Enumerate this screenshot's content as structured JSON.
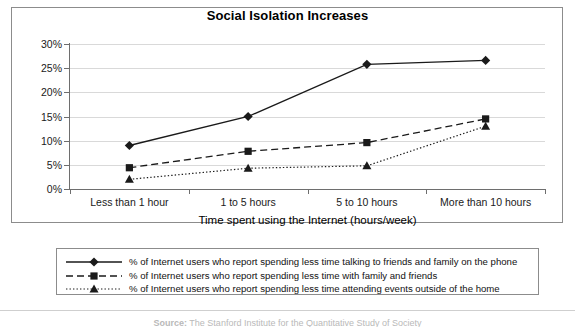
{
  "chart_data": {
    "type": "line",
    "title": "Social Isolation Increases",
    "xlabel": "Time spent using the Internet (hours/week)",
    "ylabel": "",
    "categories": [
      "Less than 1 hour",
      "1 to 5 hours",
      "5 to 10 hours",
      "More than 10 hours"
    ],
    "ylim": [
      0,
      30
    ],
    "yticks": [
      "0%",
      "5%",
      "10%",
      "15%",
      "20%",
      "25%",
      "30%"
    ],
    "ytick_values": [
      0,
      5,
      10,
      15,
      20,
      25,
      30
    ],
    "grid": true,
    "legend_position": "bottom",
    "series": [
      {
        "name": "% of Internet users who report spending less time talking to friends and family on the phone",
        "marker": "diamond",
        "line_style": "solid",
        "color": "#1a1a1a",
        "values": [
          9.0,
          15.0,
          25.8,
          26.6
        ]
      },
      {
        "name": "% of Internet users who report spending less time with family and friends",
        "marker": "square",
        "line_style": "dashed",
        "color": "#1a1a1a",
        "values": [
          4.4,
          7.8,
          9.6,
          14.5
        ]
      },
      {
        "name": "% of Internet users who report spending less time attending events outside of the home",
        "marker": "triangle",
        "line_style": "dotted",
        "color": "#1a1a1a",
        "values": [
          2.0,
          4.3,
          4.8,
          13.0
        ]
      }
    ]
  },
  "source_note": {
    "label": "Source:",
    "text": "The Stanford Institute for the Quantitative Study of Society"
  }
}
